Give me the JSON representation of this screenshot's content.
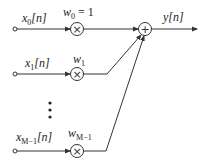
{
  "diagram": {
    "type": "linear-combiner",
    "inputs": [
      {
        "label": "x",
        "sub": "0",
        "suffix": "[n]"
      },
      {
        "label": "x",
        "sub": "1",
        "suffix": "[n]"
      },
      {
        "label": "x",
        "sub": "M−1",
        "suffix": "[n]"
      }
    ],
    "weights": [
      {
        "label": "w",
        "sub": "0",
        "suffix": " = 1"
      },
      {
        "label": "w",
        "sub": "1",
        "suffix": ""
      },
      {
        "label": "w",
        "sub": "M−1",
        "suffix": ""
      }
    ],
    "multiplier_symbol": "×",
    "adder_symbol": "+",
    "output": {
      "label": "y",
      "suffix": "[n]"
    },
    "ellipsis": "⋮"
  }
}
